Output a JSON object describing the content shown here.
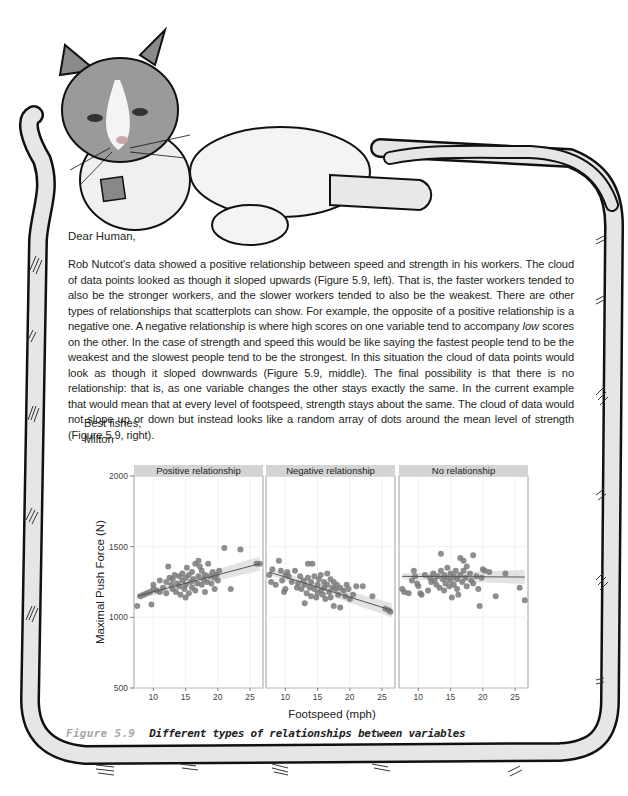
{
  "letter": {
    "salutation": "Dear Human,",
    "paragraph_parts": [
      "Rob Nutcot's data showed a positive relationship between speed and strength in his workers. The cloud of data points looked as though it sloped upwards (Figure 5.9, left). That is, the faster workers tended to also be the stronger workers, and the slower workers tended to also be the weakest. There are other types of relationships that scatterplots can show. For example, the opposite of a positive relationship is a negative one. A negative relationship is where high scores on one variable tend to accompany ",
      "low",
      " scores on the other. In the case of strength and speed this would be like saying the fastest people tend to be the weakest and the slowest people tend to be the strongest. In this situation the cloud of data points would look as though it sloped downwards (Figure 5.9, middle). The final possibility is that there is no relationship: that is, as one variable changes the other stays exactly the same. In the current example that would mean that at every level of footspeed, strength stays about the same. The cloud of data would not slope up or down but instead looks like a random array of dots around the mean level of strength (Figure 5.9, right)."
    ],
    "closing": "Best fishes,",
    "signature": "Milton"
  },
  "caption": {
    "number": "Figure 5.9",
    "title": "Different types of relationships between variables"
  },
  "colors": {
    "point": "#7a7a7a",
    "strip": "#d4d4d4",
    "line": "#555555",
    "band": "#dcdcdc",
    "grid": "#eeeeee",
    "frame_fill": "#e6e6e6",
    "frame_stroke": "#111111",
    "caption_number": "#a8a8a8"
  },
  "chart_data": {
    "type": "scatter",
    "title": "",
    "xlabel": "Footspeed (mph)",
    "ylabel": "Maximal Push Force (N)",
    "xlim": [
      7,
      27
    ],
    "ylim": [
      500,
      2000
    ],
    "x_ticks": [
      10,
      15,
      20,
      25
    ],
    "y_ticks": [
      500,
      1000,
      1500,
      2000
    ],
    "grid": true,
    "legend": null,
    "facets": [
      {
        "name": "Positive relationship",
        "trend": {
          "x": [
            7.5,
            26.5
          ],
          "y": [
            1150,
            1380
          ]
        },
        "points": [
          [
            7.5,
            1080
          ],
          [
            8,
            1150
          ],
          [
            8.5,
            1160
          ],
          [
            9,
            1170
          ],
          [
            9.5,
            1180
          ],
          [
            9.7,
            1090
          ],
          [
            10,
            1200
          ],
          [
            10,
            1230
          ],
          [
            10.5,
            1190
          ],
          [
            11,
            1260
          ],
          [
            11,
            1180
          ],
          [
            11.5,
            1210
          ],
          [
            12,
            1170
          ],
          [
            12,
            1250
          ],
          [
            12.3,
            1360
          ],
          [
            12.5,
            1280
          ],
          [
            12.8,
            1230
          ],
          [
            13,
            1200
          ],
          [
            13,
            1270
          ],
          [
            13.3,
            1300
          ],
          [
            13.5,
            1180
          ],
          [
            13.7,
            1240
          ],
          [
            14,
            1220
          ],
          [
            14,
            1290
          ],
          [
            14.2,
            1160
          ],
          [
            14.5,
            1260
          ],
          [
            14.5,
            1310
          ],
          [
            14.8,
            1200
          ],
          [
            15,
            1140
          ],
          [
            15,
            1230
          ],
          [
            15,
            1280
          ],
          [
            15.2,
            1350
          ],
          [
            15.5,
            1170
          ],
          [
            15.5,
            1300
          ],
          [
            15.8,
            1250
          ],
          [
            16,
            1210
          ],
          [
            16,
            1320
          ],
          [
            16.2,
            1270
          ],
          [
            16.5,
            1190
          ],
          [
            16.5,
            1380
          ],
          [
            16.8,
            1240
          ],
          [
            17,
            1290
          ],
          [
            17,
            1400
          ],
          [
            17.2,
            1360
          ],
          [
            17.5,
            1230
          ],
          [
            17.5,
            1330
          ],
          [
            17.8,
            1270
          ],
          [
            18,
            1180
          ],
          [
            18,
            1300
          ],
          [
            18.3,
            1250
          ],
          [
            18.5,
            1380
          ],
          [
            18.8,
            1290
          ],
          [
            19,
            1240
          ],
          [
            19.2,
            1320
          ],
          [
            19.5,
            1200
          ],
          [
            19.5,
            1280
          ],
          [
            19.8,
            1300
          ],
          [
            20,
            1260
          ],
          [
            20.2,
            1330
          ],
          [
            21,
            1490
          ],
          [
            22,
            1200
          ],
          [
            23.5,
            1480
          ],
          [
            26,
            1380
          ],
          [
            26.5,
            1380
          ]
        ]
      },
      {
        "name": "Negative relationship",
        "trend": {
          "x": [
            7.5,
            26.5
          ],
          "y": [
            1320,
            1050
          ]
        },
        "points": [
          [
            7.5,
            1300
          ],
          [
            7.8,
            1250
          ],
          [
            8,
            1340
          ],
          [
            8.5,
            1230
          ],
          [
            9,
            1400
          ],
          [
            9.3,
            1330
          ],
          [
            9.5,
            1260
          ],
          [
            9.8,
            1180
          ],
          [
            10,
            1300
          ],
          [
            10,
            1200
          ],
          [
            10.3,
            1320
          ],
          [
            10.5,
            1290
          ],
          [
            11,
            1250
          ],
          [
            11.5,
            1330
          ],
          [
            11.8,
            1210
          ],
          [
            12,
            1240
          ],
          [
            12.3,
            1290
          ],
          [
            12.5,
            1200
          ],
          [
            12.8,
            1260
          ],
          [
            13,
            1100
          ],
          [
            13,
            1230
          ],
          [
            13.3,
            1170
          ],
          [
            13.5,
            1380
          ],
          [
            13.5,
            1280
          ],
          [
            13.8,
            1210
          ],
          [
            14,
            1250
          ],
          [
            14,
            1150
          ],
          [
            14.2,
            1380
          ],
          [
            14.5,
            1290
          ],
          [
            14.5,
            1200
          ],
          [
            14.8,
            1140
          ],
          [
            15,
            1230
          ],
          [
            15,
            1170
          ],
          [
            15.2,
            1270
          ],
          [
            15.5,
            1300
          ],
          [
            15.5,
            1190
          ],
          [
            15.8,
            1160
          ],
          [
            16,
            1250
          ],
          [
            16,
            1210
          ],
          [
            16.2,
            1130
          ],
          [
            16.5,
            1310
          ],
          [
            16.5,
            1230
          ],
          [
            16.8,
            1180
          ],
          [
            17,
            1270
          ],
          [
            17,
            1140
          ],
          [
            17.3,
            1210
          ],
          [
            17.5,
            1080
          ],
          [
            17.5,
            1250
          ],
          [
            17.8,
            1200
          ],
          [
            18,
            1230
          ],
          [
            18.2,
            1160
          ],
          [
            18.5,
            1070
          ],
          [
            18.5,
            1210
          ],
          [
            19,
            1190
          ],
          [
            19.3,
            1150
          ],
          [
            19.5,
            1230
          ],
          [
            19.8,
            1200
          ],
          [
            20,
            1130
          ],
          [
            20.5,
            1160
          ],
          [
            21,
            1220
          ],
          [
            22,
            1220
          ],
          [
            23.5,
            1150
          ],
          [
            25.5,
            1060
          ],
          [
            26,
            1050
          ],
          [
            26.3,
            1040
          ]
        ]
      },
      {
        "name": "No relationship",
        "trend": {
          "x": [
            7.5,
            26.5
          ],
          "y": [
            1290,
            1285
          ]
        },
        "points": [
          [
            7.5,
            1200
          ],
          [
            7.8,
            1180
          ],
          [
            8.5,
            1170
          ],
          [
            9,
            1260
          ],
          [
            9.3,
            1330
          ],
          [
            9.5,
            1290
          ],
          [
            9.8,
            1240
          ],
          [
            10,
            1220
          ],
          [
            10.3,
            1170
          ],
          [
            10.5,
            1160
          ],
          [
            11,
            1300
          ],
          [
            11.5,
            1190
          ],
          [
            11.8,
            1280
          ],
          [
            12,
            1250
          ],
          [
            12.3,
            1310
          ],
          [
            12.5,
            1260
          ],
          [
            12.8,
            1230
          ],
          [
            13,
            1290
          ],
          [
            13.3,
            1210
          ],
          [
            13.5,
            1450
          ],
          [
            13.5,
            1330
          ],
          [
            13.8,
            1270
          ],
          [
            14,
            1190
          ],
          [
            14,
            1300
          ],
          [
            14.2,
            1240
          ],
          [
            14.5,
            1350
          ],
          [
            14.5,
            1280
          ],
          [
            14.8,
            1220
          ],
          [
            15,
            1310
          ],
          [
            15,
            1260
          ],
          [
            15.2,
            1140
          ],
          [
            15.5,
            1290
          ],
          [
            15.5,
            1230
          ],
          [
            15.8,
            1330
          ],
          [
            16,
            1200
          ],
          [
            16,
            1270
          ],
          [
            16.2,
            1160
          ],
          [
            16.5,
            1300
          ],
          [
            16.5,
            1420
          ],
          [
            16.8,
            1250
          ],
          [
            17,
            1400
          ],
          [
            17,
            1330
          ],
          [
            17.3,
            1280
          ],
          [
            17.5,
            1220
          ],
          [
            17.5,
            1360
          ],
          [
            18,
            1310
          ],
          [
            18.2,
            1260
          ],
          [
            18.5,
            1440
          ],
          [
            18.5,
            1240
          ],
          [
            19,
            1290
          ],
          [
            19.3,
            1200
          ],
          [
            19.5,
            1080
          ],
          [
            19.8,
            1280
          ],
          [
            20,
            1340
          ],
          [
            20.3,
            1330
          ],
          [
            21,
            1320
          ],
          [
            22,
            1150
          ],
          [
            23.5,
            1310
          ],
          [
            25.7,
            1210
          ],
          [
            26.5,
            1120
          ]
        ]
      }
    ]
  }
}
